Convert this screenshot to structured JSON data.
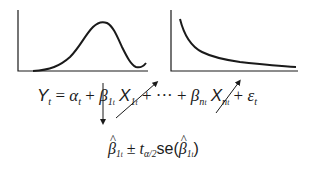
{
  "diagram": {
    "left_chart": {
      "shape": "bell-curve",
      "description": "Unimodal hump-shaped curve rising from left, peaking near center-right, dipping and rising slightly at the right end"
    },
    "right_chart": {
      "shape": "decay-curve",
      "description": "Monotonically decreasing convex curve approaching the horizontal axis"
    },
    "equation": {
      "lhs": "Y",
      "lhs_sub": "t",
      "equals": "=",
      "alpha": "α",
      "alpha_sub": "t",
      "plus": "+",
      "beta1": "β",
      "beta1_sub": "1",
      "beta1_subsub": "t",
      "x1": "X",
      "x1_sub": "1",
      "x1_subsub": "t",
      "ellipsis": "···",
      "betan": "β",
      "betan_sub": "n",
      "betan_subsub": "t",
      "xn": "X",
      "xn_sub": "n",
      "xn_subsub": "t",
      "epsilon": "ε",
      "epsilon_sub": "t"
    },
    "interval": {
      "beta": "β",
      "beta_sub": "1",
      "beta_subsub": "t",
      "pm": "±",
      "t": "t",
      "t_sub": "α/2",
      "se": "se(",
      "close": ")"
    },
    "colors": {
      "line": "#1a1a1a",
      "background": "#ffffff"
    }
  }
}
